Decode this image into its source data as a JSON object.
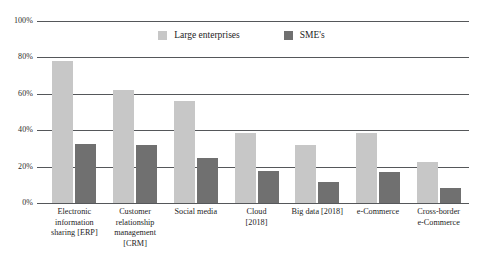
{
  "chart_data": {
    "type": "bar",
    "title": "",
    "subtitle": "",
    "xlabel": "",
    "ylabel": "",
    "ylim": [
      0,
      100
    ],
    "yticks": [
      "0%",
      "20%",
      "40%",
      "60%",
      "80%",
      "100%"
    ],
    "ytick_values": [
      0,
      20,
      40,
      60,
      80,
      100
    ],
    "grid": true,
    "legend_position": "top-center",
    "categories": [
      "Electronic information sharing [ERP]",
      "Customer relationship management [CRM]",
      "Social media",
      "Cloud [2018]",
      "Big data [2018]",
      "e-Commerce",
      "Cross-border e-Commerce"
    ],
    "category_lines": [
      [
        "Electronic",
        "information",
        "sharing [ERP]"
      ],
      [
        "Customer",
        "relationship",
        "management",
        "[CRM]"
      ],
      [
        "Social media"
      ],
      [
        "Cloud",
        "[2018]"
      ],
      [
        "Big data [2018]"
      ],
      [
        "e-Commerce"
      ],
      [
        "Cross-border",
        "e-Commerce"
      ]
    ],
    "series": [
      {
        "name": "Large enterprises",
        "color": "#c7c7c7",
        "values": [
          78,
          62,
          56,
          38.5,
          32,
          38.5,
          22.5
        ]
      },
      {
        "name": "SME's",
        "color": "#707070",
        "values": [
          32.5,
          32,
          24.5,
          17.5,
          11.5,
          17,
          8.5
        ]
      }
    ]
  },
  "legend": {
    "items": [
      {
        "label": "Large enterprises",
        "color": "#c7c7c7"
      },
      {
        "label": "SME's",
        "color": "#707070"
      }
    ]
  },
  "axis": {
    "y_tick_labels": [
      "100%",
      "80%",
      "60%",
      "40%",
      "20%",
      "0%"
    ]
  }
}
